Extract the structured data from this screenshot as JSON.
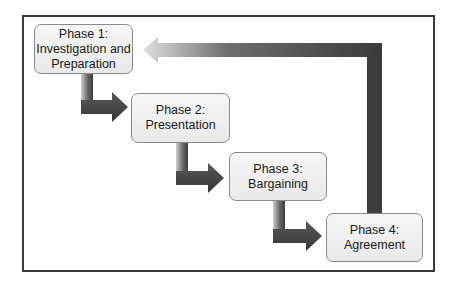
{
  "diagram": {
    "type": "cyclical process flow",
    "phases": [
      {
        "title": "Phase 1:",
        "name_lines": [
          "Investigation and",
          "Preparation"
        ]
      },
      {
        "title": "Phase 2:",
        "name_lines": [
          "Presentation"
        ]
      },
      {
        "title": "Phase 3:",
        "name_lines": [
          "Bargaining"
        ]
      },
      {
        "title": "Phase 4:",
        "name_lines": [
          "Agreement"
        ]
      }
    ],
    "connections": [
      {
        "from": "Phase 1",
        "to": "Phase 2"
      },
      {
        "from": "Phase 2",
        "to": "Phase 3"
      },
      {
        "from": "Phase 3",
        "to": "Phase 4"
      },
      {
        "from": "Phase 4",
        "to": "Phase 1",
        "style": "return loop"
      }
    ],
    "colors": {
      "frame": "#3a3a3a",
      "arrow_dark": "#3c3c3c",
      "arrow_light": "#c8c8c8",
      "box_fill": "#efefef",
      "box_border": "#8a8a8a"
    }
  }
}
